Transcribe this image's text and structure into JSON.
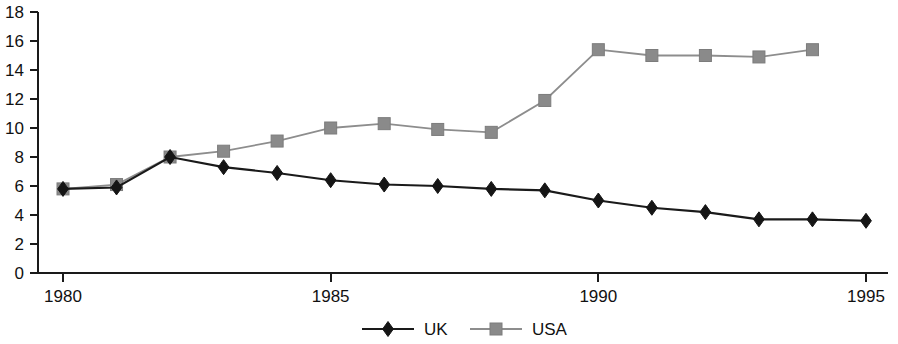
{
  "chart_data": {
    "type": "line",
    "title": "",
    "subtitle": "",
    "xlabel": "",
    "ylabel": "",
    "x": [
      1980,
      1981,
      1982,
      1983,
      1984,
      1985,
      1986,
      1987,
      1988,
      1989,
      1990,
      1991,
      1992,
      1993,
      1994,
      1995
    ],
    "xlim": [
      1980,
      1995
    ],
    "ylim": [
      0,
      18
    ],
    "y_ticks": [
      0,
      2,
      4,
      6,
      8,
      10,
      12,
      14,
      16,
      18
    ],
    "y_tick_labels": [
      "0",
      "2",
      "4",
      "6",
      "8",
      "10",
      "12",
      "14",
      "16",
      "18"
    ],
    "x_ticks": [
      1980,
      1985,
      1990,
      1995
    ],
    "x_tick_labels": [
      "1980",
      "1985",
      "1990",
      "1995"
    ],
    "grid": false,
    "legend_position": "bottom-center",
    "series": [
      {
        "name": "UK",
        "marker": "diamond",
        "color": "#151515",
        "line_color": "#1a1a1a",
        "x": [
          1980,
          1981,
          1982,
          1983,
          1984,
          1985,
          1986,
          1987,
          1988,
          1989,
          1990,
          1991,
          1992,
          1993,
          1994,
          1995
        ],
        "values": [
          5.8,
          5.9,
          8.0,
          7.3,
          6.9,
          6.4,
          6.1,
          6.0,
          5.8,
          5.7,
          5.0,
          4.5,
          4.2,
          3.7,
          3.7,
          3.6
        ]
      },
      {
        "name": "USA",
        "marker": "square",
        "color": "#8a8a8a",
        "line_color": "#8d8d8d",
        "x": [
          1980,
          1981,
          1982,
          1983,
          1984,
          1985,
          1986,
          1987,
          1988,
          1989,
          1990,
          1991,
          1992,
          1993,
          1994
        ],
        "values": [
          5.8,
          6.1,
          8.0,
          8.4,
          9.1,
          10.0,
          10.3,
          9.9,
          9.7,
          11.9,
          15.4,
          15.0,
          15.0,
          14.9,
          15.4
        ]
      }
    ],
    "legend": [
      {
        "label": "UK",
        "marker": "diamond",
        "color": "#151515"
      },
      {
        "label": "USA",
        "marker": "square",
        "color": "#8a8a8a"
      }
    ],
    "annotations": []
  },
  "axes": {
    "y_axis_name": "value-axis",
    "x_axis_name": "year-axis"
  }
}
